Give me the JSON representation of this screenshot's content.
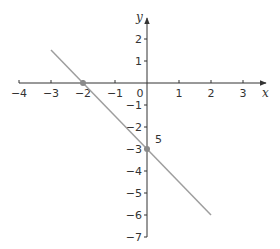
{
  "chart_data": {
    "type": "line",
    "title": "",
    "xlabel": "x",
    "ylabel": "y",
    "xlim": [
      -4,
      3
    ],
    "ylim": [
      -7,
      2
    ],
    "grid": false,
    "x_ticks": [
      "-4",
      "-3",
      "-2",
      "-1",
      "0",
      "1",
      "2",
      "3"
    ],
    "y_ticks": [
      "2",
      "1",
      "-1",
      "-2",
      "-3",
      "-4",
      "-5",
      "-6",
      "-7"
    ],
    "series": [
      {
        "name": "line",
        "equation": "y = -1.5x - 3",
        "x": [
          -3,
          2
        ],
        "y": [
          1.5,
          -6
        ],
        "color": "#9e9e9e"
      }
    ],
    "points": [
      {
        "x": -2,
        "y": 0,
        "label": ""
      },
      {
        "x": 0,
        "y": -3,
        "label": "5"
      }
    ],
    "annotations": [
      "5"
    ]
  },
  "colors": {
    "axis": "#333333",
    "line": "#9e9e9e",
    "point": "#8a8a8a"
  }
}
